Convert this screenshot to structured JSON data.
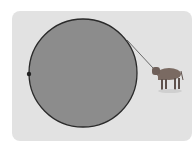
{
  "diagram": {
    "elements": [
      "circle",
      "tether-point",
      "rope",
      "cow"
    ],
    "colors": {
      "background_card": "#e2e2e2",
      "circle_fill": "#8c8c8c",
      "circle_stroke": "#2a2a2a",
      "rope": "#6a6a6a",
      "cow": "#7a6a62"
    }
  }
}
